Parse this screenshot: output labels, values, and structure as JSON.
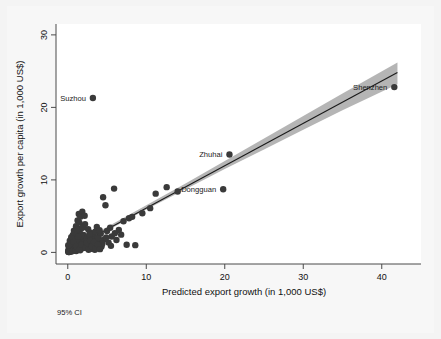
{
  "figure": {
    "note": "95% CI",
    "background_color": "#f4f4f4",
    "panel_color": "#ffffff"
  },
  "chart_data": {
    "type": "scatter",
    "title": "",
    "subtitle": "",
    "xlabel": "Predicted export growth (in 1,000 US$)",
    "ylabel": "Export growth per capita (in 1,000 US$)",
    "xlim": [
      -1.5,
      45
    ],
    "ylim": [
      -1.6,
      31.5
    ],
    "xticks": [
      0,
      10,
      20,
      30,
      40
    ],
    "xtick_labels": [
      "0",
      "10",
      "20",
      "30",
      "40"
    ],
    "yticks": [
      0,
      10,
      20,
      30
    ],
    "ytick_labels": [
      "0",
      "10",
      "20",
      "30"
    ],
    "grid": false,
    "legend": "95% CI",
    "legend_position": "below-left",
    "marker_color": "#3a3a3a",
    "line_color": "#1a1a1a",
    "ci_color": "#a8a8a8",
    "fit_line": {
      "name": "Linear fit",
      "slope": 0.585,
      "intercept": 0.25,
      "x_start": 0.0,
      "x_end": 42.0
    },
    "ci_band": {
      "name": "95% CI",
      "x": [
        0,
        5,
        10,
        15,
        20,
        25,
        30,
        35,
        42
      ],
      "lower": [
        0.0,
        3.0,
        5.9,
        8.7,
        11.5,
        14.2,
        16.9,
        19.6,
        23.2
      ],
      "upper": [
        0.6,
        3.5,
        6.5,
        9.5,
        12.6,
        15.7,
        18.8,
        21.9,
        26.2
      ]
    },
    "annotations": [
      {
        "label": "Suzhou",
        "x": 3.2,
        "y": 21.3,
        "label_side": "left"
      },
      {
        "label": "Zhuhai",
        "x": 20.6,
        "y": 13.5,
        "label_side": "left"
      },
      {
        "label": "Dongguan",
        "x": 19.8,
        "y": 8.7,
        "label_side": "left"
      },
      {
        "label": "Shenzhen",
        "x": 41.6,
        "y": 22.8,
        "label_side": "left"
      }
    ],
    "series": [
      {
        "name": "Cities",
        "points": [
          [
            0.05,
            0.1
          ],
          [
            0.1,
            0.2
          ],
          [
            0.12,
            0.05
          ],
          [
            0.15,
            0.35
          ],
          [
            0.18,
            0.6
          ],
          [
            0.2,
            0.15
          ],
          [
            0.22,
            0.85
          ],
          [
            0.25,
            0.45
          ],
          [
            0.28,
            1.1
          ],
          [
            0.3,
            0.25
          ],
          [
            0.32,
            0.7
          ],
          [
            0.35,
            1.4
          ],
          [
            0.38,
            0.5
          ],
          [
            0.4,
            0.95
          ],
          [
            0.42,
            0.2
          ],
          [
            0.45,
            1.7
          ],
          [
            0.48,
            0.65
          ],
          [
            0.5,
            1.2
          ],
          [
            0.52,
            0.3
          ],
          [
            0.55,
            2.0
          ],
          [
            0.58,
            0.8
          ],
          [
            0.6,
            1.5
          ],
          [
            0.62,
            0.4
          ],
          [
            0.65,
            2.4
          ],
          [
            0.68,
            1.0
          ],
          [
            0.7,
            0.55
          ],
          [
            0.72,
            1.85
          ],
          [
            0.75,
            0.25
          ],
          [
            0.78,
            3.0
          ],
          [
            0.8,
            1.3
          ],
          [
            0.85,
            0.7
          ],
          [
            0.88,
            2.2
          ],
          [
            0.9,
            0.45
          ],
          [
            0.95,
            1.6
          ],
          [
            1.0,
            0.9
          ],
          [
            1.05,
            3.6
          ],
          [
            1.1,
            0.35
          ],
          [
            1.15,
            2.6
          ],
          [
            1.2,
            1.1
          ],
          [
            1.25,
            4.4
          ],
          [
            1.3,
            0.6
          ],
          [
            1.35,
            1.95
          ],
          [
            1.4,
            5.3
          ],
          [
            1.45,
            0.8
          ],
          [
            1.5,
            2.9
          ],
          [
            1.55,
            1.25
          ],
          [
            1.6,
            4.9
          ],
          [
            1.65,
            0.5
          ],
          [
            1.7,
            3.3
          ],
          [
            1.8,
            1.7
          ],
          [
            1.85,
            5.6
          ],
          [
            1.9,
            0.95
          ],
          [
            2.0,
            2.4
          ],
          [
            2.1,
            1.3
          ],
          [
            2.2,
            3.9
          ],
          [
            2.3,
            0.7
          ],
          [
            2.4,
            2.05
          ],
          [
            2.5,
            1.45
          ],
          [
            2.6,
            3.2
          ],
          [
            2.7,
            0.85
          ],
          [
            2.8,
            1.9
          ],
          [
            2.9,
            2.7
          ],
          [
            3.0,
            1.15
          ],
          [
            3.1,
            0.55
          ],
          [
            3.2,
            2.3
          ],
          [
            3.3,
            1.6
          ],
          [
            3.4,
            0.95
          ],
          [
            3.5,
            2.85
          ],
          [
            3.6,
            1.25
          ],
          [
            3.7,
            3.5
          ],
          [
            3.8,
            0.65
          ],
          [
            3.9,
            2.1
          ],
          [
            4.0,
            1.4
          ],
          [
            4.2,
            2.6
          ],
          [
            4.3,
            0.8
          ],
          [
            4.5,
            7.6
          ],
          [
            4.6,
            1.8
          ],
          [
            4.8,
            6.5
          ],
          [
            5.0,
            2.95
          ],
          [
            5.2,
            1.35
          ],
          [
            5.4,
            3.4
          ],
          [
            5.6,
            2.2
          ],
          [
            5.9,
            8.8
          ],
          [
            6.2,
            1.7
          ],
          [
            6.5,
            3.1
          ],
          [
            6.8,
            2.45
          ],
          [
            7.1,
            4.3
          ],
          [
            7.5,
            1.05
          ],
          [
            7.8,
            4.7
          ],
          [
            8.2,
            4.9
          ],
          [
            8.6,
            1.0
          ],
          [
            9.5,
            5.4
          ],
          [
            10.5,
            6.1
          ],
          [
            11.2,
            8.1
          ],
          [
            12.6,
            9.0
          ],
          [
            14.0,
            8.4
          ],
          [
            0.08,
            0.3
          ],
          [
            0.14,
            0.75
          ],
          [
            0.26,
            1.6
          ],
          [
            0.34,
            0.1
          ],
          [
            0.44,
            2.1
          ],
          [
            0.54,
            0.6
          ],
          [
            0.64,
            1.35
          ],
          [
            0.74,
            0.4
          ],
          [
            0.84,
            2.75
          ],
          [
            0.94,
            1.05
          ],
          [
            1.08,
            0.2
          ],
          [
            1.18,
            3.15
          ],
          [
            1.28,
            0.75
          ],
          [
            1.38,
            1.55
          ],
          [
            1.48,
            4.1
          ],
          [
            1.58,
            0.3
          ],
          [
            1.68,
            2.25
          ],
          [
            1.78,
            1.15
          ],
          [
            1.98,
            0.6
          ],
          [
            2.15,
            5.05
          ],
          [
            2.35,
            1.55
          ],
          [
            2.55,
            0.95
          ],
          [
            2.75,
            2.5
          ],
          [
            2.95,
            0.5
          ],
          [
            3.15,
            1.75
          ],
          [
            3.45,
            0.35
          ],
          [
            3.75,
            1.95
          ],
          [
            4.05,
            3.05
          ],
          [
            4.4,
            1.2
          ],
          [
            4.9,
            2.05
          ],
          [
            5.5,
            0.9
          ],
          [
            6.0,
            2.65
          ],
          [
            0.06,
            1.0
          ],
          [
            0.16,
            0.05
          ],
          [
            0.36,
            1.25
          ],
          [
            0.56,
            0.15
          ],
          [
            0.76,
            1.45
          ],
          [
            0.96,
            0.25
          ],
          [
            1.12,
            0.85
          ],
          [
            1.32,
            2.15
          ],
          [
            1.52,
            0.45
          ],
          [
            1.72,
            1.05
          ],
          [
            1.92,
            3.45
          ],
          [
            2.25,
            0.65
          ],
          [
            2.45,
            1.25
          ],
          [
            2.65,
            0.35
          ],
          [
            2.85,
            1.65
          ],
          [
            3.05,
            0.8
          ],
          [
            3.35,
            1.45
          ],
          [
            3.55,
            0.55
          ],
          [
            3.85,
            1.05
          ],
          [
            4.1,
            0.45
          ],
          [
            3.2,
            21.3
          ],
          [
            20.6,
            13.5
          ],
          [
            19.8,
            8.7
          ],
          [
            41.6,
            22.8
          ]
        ]
      }
    ]
  },
  "axis": {
    "y_title": "Export growth per capita (in 1,000 US$)",
    "x_title": "Predicted export growth (in 1,000 US$)"
  }
}
